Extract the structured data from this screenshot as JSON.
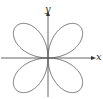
{
  "diagram": {
    "type": "polar-curve",
    "curve": "four-leaved rose",
    "equation_form": "r = sin(2θ)",
    "petals": 4,
    "axes": {
      "x_label": "x",
      "y_label": "y"
    },
    "colors": {
      "curve": "#6a6a6a",
      "axes": "#555555",
      "labels": "#333333",
      "background": "#ffffff"
    },
    "layout": {
      "origin": [
        48,
        58
      ],
      "petal_radius_px": 45,
      "x_axis_from": 1,
      "x_axis_to": 93,
      "y_axis_from": 97,
      "y_axis_to": 14
    }
  }
}
